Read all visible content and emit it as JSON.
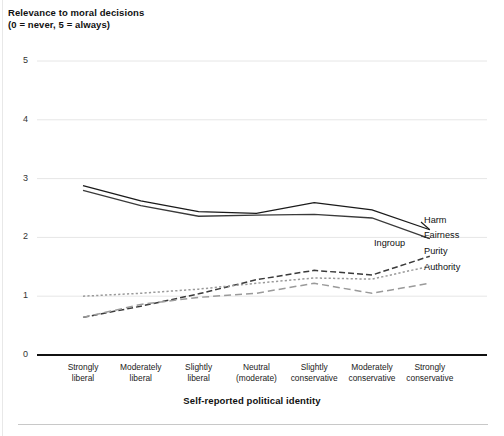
{
  "chart_data": {
    "type": "line",
    "title": "Relevance to moral decisions",
    "subtitle": "(0 = never, 5 = always)",
    "xlabel": "Self-reported political identity",
    "ylabel": "",
    "ylim": [
      0,
      5
    ],
    "yticks": [
      "0",
      "1",
      "2",
      "3",
      "4",
      "5"
    ],
    "grid": true,
    "legend_position": "right-inline",
    "categories": [
      "Strongly\nliberal",
      "Moderately\nliberal",
      "Slightly\nliberal",
      "Neutral\n(moderate)",
      "Slightly\nconservative",
      "Moderately\nconservative",
      "Strongly\nconservative"
    ],
    "category_lines": [
      [
        "Strongly",
        "liberal"
      ],
      [
        "Moderately",
        "liberal"
      ],
      [
        "Slightly",
        "liberal"
      ],
      [
        "Neutral",
        "(moderate)"
      ],
      [
        "Slightly",
        "conservative"
      ],
      [
        "Moderately",
        "conservative"
      ],
      [
        "Strongly",
        "conservative"
      ]
    ],
    "series": [
      {
        "name": "Harm",
        "style": "solid",
        "color": "#1a1a1a",
        "values": [
          2.88,
          2.62,
          2.44,
          2.41,
          2.59,
          2.47,
          2.13
        ]
      },
      {
        "name": "Fairness",
        "style": "solid",
        "color": "#3a3a3a",
        "values": [
          2.8,
          2.54,
          2.36,
          2.38,
          2.39,
          2.33,
          1.98
        ]
      },
      {
        "name": "Ingroup",
        "style": "dashed",
        "color": "#3a3a3a",
        "values": [
          0.64,
          0.83,
          1.04,
          1.28,
          1.44,
          1.36,
          1.68
        ]
      },
      {
        "name": "Purity",
        "style": "dotted",
        "color": "#9a9a9a",
        "values": [
          1.0,
          1.05,
          1.12,
          1.22,
          1.31,
          1.29,
          1.51
        ]
      },
      {
        "name": "Authority",
        "style": "dashed-light",
        "color": "#9a9a9a",
        "values": [
          0.64,
          0.86,
          0.98,
          1.05,
          1.22,
          1.05,
          1.22
        ]
      }
    ]
  }
}
